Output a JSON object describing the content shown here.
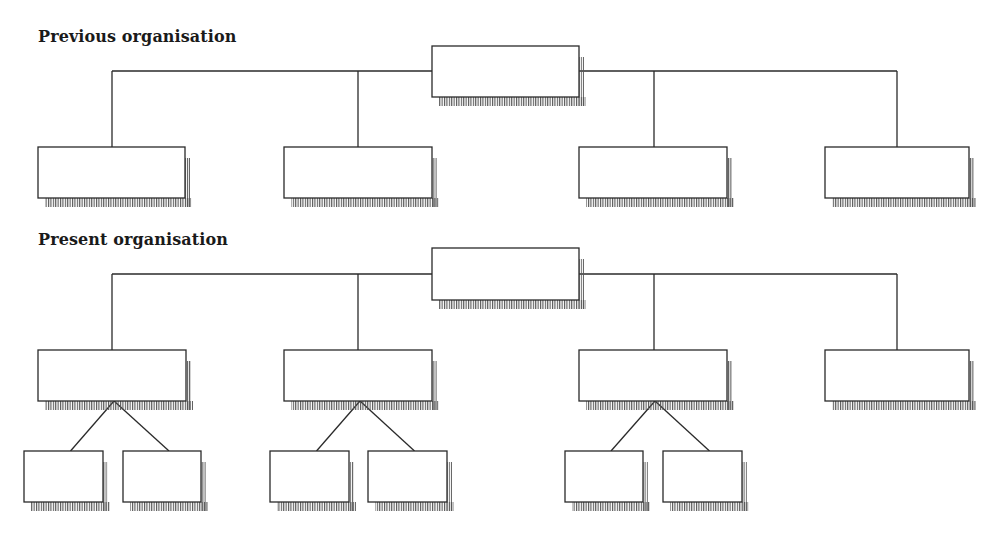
{
  "colors": {
    "line": "#2a2a2a",
    "box_fill": "#ffffff",
    "hatch": "#555555",
    "background": "#ffffff"
  },
  "sections": [
    {
      "id": "previous",
      "title": "Previous organisation",
      "title_pos": {
        "x": 38,
        "y": 27
      },
      "bus_y": 71,
      "root": {
        "x": 432,
        "y": 46,
        "w": 147,
        "h": 51,
        "label": ""
      },
      "children": [
        {
          "x": 38,
          "y": 147,
          "w": 147,
          "h": 51,
          "label": "",
          "stem_x": 112,
          "subs": []
        },
        {
          "x": 284,
          "y": 147,
          "w": 148,
          "h": 51,
          "label": "",
          "stem_x": 358,
          "subs": []
        },
        {
          "x": 579,
          "y": 147,
          "w": 148,
          "h": 51,
          "label": "",
          "stem_x": 654,
          "subs": []
        },
        {
          "x": 825,
          "y": 147,
          "w": 144,
          "h": 51,
          "label": "",
          "stem_x": 897,
          "subs": []
        }
      ]
    },
    {
      "id": "present",
      "title": "Present organisation",
      "title_pos": {
        "x": 38,
        "y": 230
      },
      "bus_y": 274,
      "root": {
        "x": 432,
        "y": 248,
        "w": 147,
        "h": 52,
        "label": ""
      },
      "children": [
        {
          "x": 38,
          "y": 350,
          "w": 148,
          "h": 51,
          "label": "",
          "stem_x": 112,
          "subs": [
            {
              "x": 24,
              "y": 451,
              "w": 79,
              "h": 51,
              "label": ""
            },
            {
              "x": 123,
              "y": 451,
              "w": 78,
              "h": 51,
              "label": ""
            }
          ]
        },
        {
          "x": 284,
          "y": 350,
          "w": 148,
          "h": 51,
          "label": "",
          "stem_x": 358,
          "subs": [
            {
              "x": 270,
              "y": 451,
              "w": 79,
              "h": 51,
              "label": ""
            },
            {
              "x": 368,
              "y": 451,
              "w": 79,
              "h": 51,
              "label": ""
            }
          ]
        },
        {
          "x": 579,
          "y": 350,
          "w": 148,
          "h": 51,
          "label": "",
          "stem_x": 654,
          "subs": [
            {
              "x": 565,
              "y": 451,
              "w": 78,
              "h": 51,
              "label": ""
            },
            {
              "x": 663,
              "y": 451,
              "w": 79,
              "h": 51,
              "label": ""
            }
          ]
        },
        {
          "x": 825,
          "y": 350,
          "w": 144,
          "h": 51,
          "label": "",
          "stem_x": 897,
          "subs": []
        }
      ]
    }
  ]
}
